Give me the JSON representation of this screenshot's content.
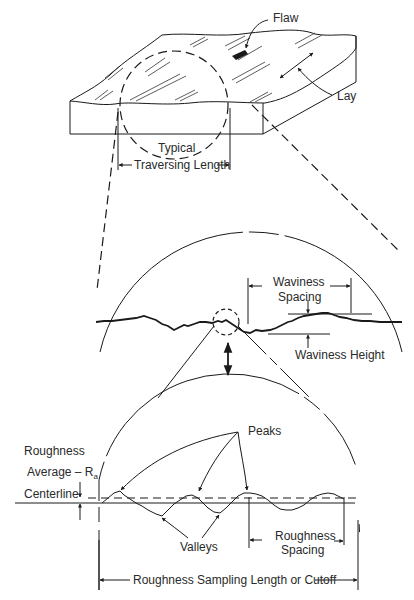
{
  "diagram": {
    "top_block": {
      "labels": {
        "flaw": "Flaw",
        "lay": "Lay",
        "typical": "Typical",
        "traversing_length": "Traversing Length"
      }
    },
    "waviness_view": {
      "labels": {
        "waviness_spacing_line1": "Waviness",
        "waviness_spacing_line2": "Spacing",
        "waviness_height": "Waviness Height"
      }
    },
    "roughness_view": {
      "labels": {
        "roughness_line1": "Roughness",
        "average_ra": "Average – R",
        "average_ra_sub": "a",
        "centerline": "Centerline",
        "peaks": "Peaks",
        "valleys": "Valleys",
        "roughness_spacing_line1": "Roughness",
        "roughness_spacing_line2": "Spacing",
        "sampling_length": "Roughness Sampling Length or Cutoff"
      }
    }
  }
}
